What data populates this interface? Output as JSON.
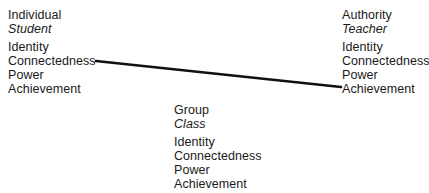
{
  "diagram": {
    "background_color": "#ffffff",
    "text_color": "#1a1a1a",
    "line_color": "#111111",
    "columns": {
      "left": {
        "heading": "Individual",
        "subheading": "Student",
        "attributes": [
          "Identity",
          "Connectedness",
          "Power",
          "Achievement"
        ]
      },
      "right": {
        "heading": "Authority",
        "subheading": "Teacher",
        "attributes": [
          "Identity",
          "Connectedness",
          "Power",
          "Achievement"
        ]
      },
      "middle": {
        "heading": "Group",
        "subheading": "Class",
        "attributes": [
          "Identity",
          "Connectedness",
          "Power",
          "Achievement"
        ]
      }
    },
    "connector": {
      "from_label": "Connectedness",
      "from_column": "left",
      "to_label": "Achievement",
      "to_column": "right",
      "x1": 96,
      "y1": 61,
      "x2": 341,
      "y2": 87,
      "stroke_width": 2.6
    }
  }
}
